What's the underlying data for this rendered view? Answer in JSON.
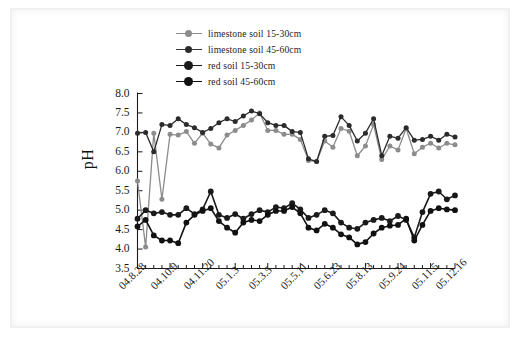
{
  "figure": {
    "ylabel": "pH",
    "background_color": "#ffffff"
  },
  "legend": {
    "position": "top-left-inside",
    "items": [
      {
        "label": "limestone soil  15-30cm",
        "color": "#8c8c8c",
        "marker": "circle",
        "marker_size": "small"
      },
      {
        "label": "limestone soil  45-60cm",
        "color": "#2b2b2b",
        "marker": "circle",
        "marker_size": "small"
      },
      {
        "label": "red soil 15-30cm",
        "color": "#1a1a1a",
        "marker": "circle",
        "marker_size": "large"
      },
      {
        "label": "red soil 45-60cm",
        "color": "#111111",
        "marker": "circle",
        "marker_size": "large"
      }
    ]
  },
  "chart_data": {
    "type": "line",
    "title": "",
    "xlabel": "",
    "ylabel": "pH",
    "ylim": [
      3.5,
      8.0
    ],
    "ytick_labels": [
      "8.0",
      "7.5",
      "7.0",
      "6.5",
      "6.0",
      "5.5",
      "5.0",
      "4.5",
      "4.0",
      "3.5"
    ],
    "ytick_values": [
      8.0,
      7.5,
      7.0,
      6.5,
      6.0,
      5.5,
      5.0,
      4.5,
      4.0,
      3.5
    ],
    "grid": false,
    "legend_position": "upper left (outside axes)",
    "n_points": 40,
    "xtick_labels": [
      "04.8.28",
      "04.10.9",
      "04.11.20",
      "05.1.3",
      "05.3.5",
      "05.5.11",
      "05.6.23",
      "05.8.13",
      "05.9.24",
      "05.11.5",
      "05.12.16"
    ],
    "xtick_indices": [
      0,
      4,
      8,
      12,
      16,
      20,
      24,
      28,
      32,
      36,
      39
    ],
    "series": [
      {
        "name": "limestone soil  15-30cm",
        "color": "#8c8c8c",
        "values": [
          5.75,
          4.05,
          6.98,
          5.28,
          6.95,
          6.93,
          7.02,
          6.72,
          6.98,
          6.7,
          6.6,
          6.93,
          7.05,
          7.18,
          7.32,
          7.5,
          7.05,
          7.05,
          6.95,
          6.95,
          6.82,
          6.28,
          6.25,
          6.78,
          6.62,
          7.1,
          7.03,
          6.4,
          6.65,
          7.2,
          6.3,
          6.65,
          6.55,
          7.1,
          6.45,
          6.62,
          6.72,
          6.6,
          6.72,
          6.68
        ]
      },
      {
        "name": "limestone soil  45-60cm",
        "color": "#2b2b2b",
        "values": [
          6.98,
          7.0,
          6.5,
          7.2,
          7.18,
          7.35,
          7.2,
          7.12,
          7.0,
          7.1,
          7.25,
          7.35,
          7.28,
          7.42,
          7.55,
          7.48,
          7.25,
          7.18,
          7.18,
          7.02,
          7.0,
          6.32,
          6.25,
          6.9,
          6.92,
          7.4,
          7.18,
          6.78,
          6.98,
          7.35,
          6.4,
          6.9,
          6.85,
          7.12,
          6.8,
          6.82,
          6.9,
          6.8,
          6.95,
          6.88
        ]
      },
      {
        "name": "red soil 15-30cm",
        "color": "#1a1a1a",
        "values": [
          4.78,
          5.0,
          4.92,
          4.95,
          4.88,
          4.88,
          5.05,
          4.9,
          5.02,
          5.48,
          4.88,
          4.8,
          4.9,
          4.78,
          4.9,
          5.0,
          4.95,
          5.08,
          5.05,
          5.18,
          5.02,
          4.8,
          4.88,
          5.0,
          4.92,
          4.68,
          4.55,
          4.52,
          4.68,
          4.75,
          4.8,
          4.72,
          4.85,
          4.75,
          4.3,
          4.95,
          5.42,
          5.48,
          5.28,
          5.38
        ]
      },
      {
        "name": "red soil 45-60cm",
        "color": "#111111",
        "values": [
          4.58,
          4.75,
          4.35,
          4.22,
          4.22,
          4.15,
          4.68,
          4.88,
          4.98,
          5.05,
          4.72,
          4.55,
          4.42,
          4.68,
          4.75,
          4.72,
          4.88,
          4.98,
          4.98,
          5.08,
          4.92,
          4.55,
          4.48,
          4.65,
          4.55,
          4.38,
          4.3,
          4.12,
          4.18,
          4.4,
          4.55,
          4.6,
          4.62,
          4.78,
          4.22,
          4.62,
          4.98,
          5.05,
          5.02,
          5.0
        ]
      }
    ]
  }
}
